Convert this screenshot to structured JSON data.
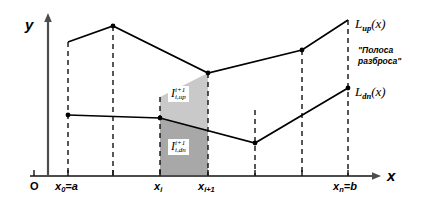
{
  "figure": {
    "type": "math-diagram"
  },
  "axes": {
    "y_label": "y",
    "x_label": "x",
    "origin_label": "O"
  },
  "ticks": [
    {
      "id": "x0",
      "label_main": "x",
      "label_sub": "0",
      "label_tail": "=a",
      "x": 68
    },
    {
      "id": "xi",
      "label_main": "x",
      "label_sub": "i",
      "label_tail": "",
      "x": 160
    },
    {
      "id": "xi1",
      "label_main": "x",
      "label_sub": "i+1",
      "label_tail": "",
      "x": 208
    },
    {
      "id": "xn",
      "label_main": "x",
      "label_sub": "n",
      "label_tail": "=b",
      "x": 348
    }
  ],
  "curves": {
    "upper": {
      "name": "L",
      "sub": "up",
      "arg": "(x)",
      "points": "68,42 113,26 208,73 302,50 348,20"
    },
    "lower": {
      "name": "L",
      "sub": "dn",
      "arg": "(x)",
      "points": "68,115 160,118 255,143 348,88"
    }
  },
  "annotations": {
    "band_note_line1": "\"Полоса",
    "band_note_line2": "разброса\""
  },
  "regions": [
    {
      "id": "upper-area",
      "symbol": "I",
      "sup": "i+1",
      "sub": "i,up",
      "fill": "#c9c9c9"
    },
    {
      "id": "lower-area",
      "symbol": "I",
      "sup": "i+1",
      "sub": "i,dn",
      "fill": "#a8a8a8"
    }
  ],
  "colors": {
    "stroke": "#000000",
    "axis": "#4d4d4d",
    "upper_fill": "#c9c9c9",
    "lower_fill": "#a8a8a8",
    "background": "#ffffff"
  }
}
